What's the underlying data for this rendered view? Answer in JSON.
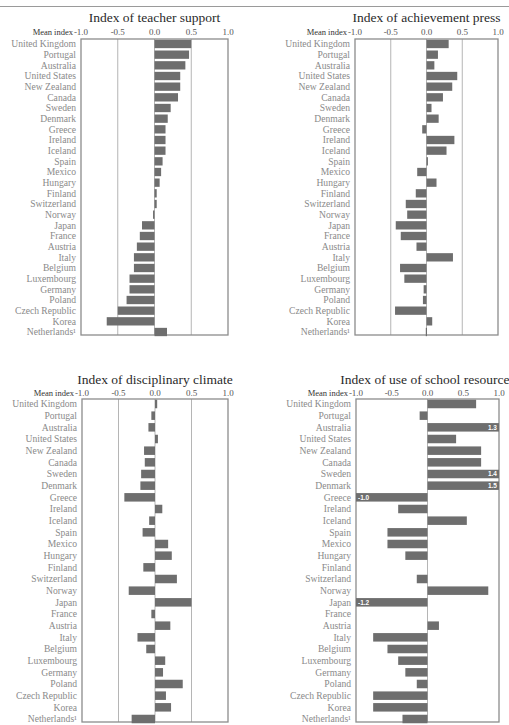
{
  "chart_data": [
    {
      "type": "bar",
      "orientation": "horizontal",
      "title": "Index of teacher support",
      "xlabel": "Mean index",
      "xlim": [
        -1.0,
        1.0
      ],
      "xticks": [
        "-1.0",
        "-0.5",
        "0.0",
        "0.5",
        "1.0"
      ],
      "grid": true,
      "categories": [
        "United Kingdom",
        "Portugal",
        "Australia",
        "United States",
        "New Zealand",
        "Canada",
        "Sweden",
        "Denmark",
        "Greece",
        "Ireland",
        "Iceland",
        "Spain",
        "Mexico",
        "Hungary",
        "Finland",
        "Switzerland",
        "Norway",
        "Japan",
        "France",
        "Austria",
        "Italy",
        "Belgium",
        "Luxembourg",
        "Germany",
        "Poland",
        "Czech Republic",
        "Korea",
        "Netherlands¹"
      ],
      "values": [
        0.5,
        0.47,
        0.42,
        0.35,
        0.35,
        0.32,
        0.22,
        0.18,
        0.15,
        0.15,
        0.15,
        0.11,
        0.09,
        0.07,
        0.03,
        0.03,
        -0.02,
        -0.17,
        -0.2,
        -0.24,
        -0.28,
        -0.28,
        -0.34,
        -0.34,
        -0.38,
        -0.5,
        -0.65,
        0.17
      ],
      "bar_labels": {}
    },
    {
      "type": "bar",
      "orientation": "horizontal",
      "title": "Index of achievement press",
      "xlabel": "Mean index",
      "xlim": [
        -1.0,
        1.0
      ],
      "xticks": [
        "-1.0",
        "-0.5",
        "0.0",
        "0.5",
        "1.0"
      ],
      "grid": true,
      "categories": [
        "United Kingdom",
        "Portugal",
        "Australia",
        "United States",
        "New Zealand",
        "Canada",
        "Sweden",
        "Denmark",
        "Greece",
        "Ireland",
        "Iceland",
        "Spain",
        "Mexico",
        "Hungary",
        "Finland",
        "Switzerland",
        "Norway",
        "Japan",
        "France",
        "Austria",
        "Italy",
        "Belgium",
        "Luxembourg",
        "Germany",
        "Poland",
        "Czech Republic",
        "Korea",
        "Netherlands¹"
      ],
      "values": [
        0.31,
        0.16,
        0.11,
        0.43,
        0.36,
        0.23,
        0.07,
        0.17,
        -0.06,
        0.39,
        0.28,
        0.02,
        -0.13,
        0.14,
        -0.15,
        -0.29,
        -0.27,
        -0.43,
        -0.36,
        -0.14,
        0.37,
        -0.37,
        -0.31,
        -0.04,
        -0.05,
        -0.44,
        0.08,
        -0.01
      ],
      "bar_labels": {}
    },
    {
      "type": "bar",
      "orientation": "horizontal",
      "title": "Index of disciplinary climate",
      "xlabel": "Mean index",
      "xlim": [
        -1.0,
        1.0
      ],
      "xticks": [
        "-1.0",
        "-0.5",
        "0.0",
        "0.5",
        "1.0"
      ],
      "grid": true,
      "categories": [
        "United Kingdom",
        "Portugal",
        "Australia",
        "United States",
        "New Zealand",
        "Canada",
        "Sweden",
        "Denmark",
        "Greece",
        "Ireland",
        "Iceland",
        "Spain",
        "Mexico",
        "Hungary",
        "Finland",
        "Switzerland",
        "Norway",
        "Japan",
        "France",
        "Austria",
        "Italy",
        "Belgium",
        "Luxembourg",
        "Germany",
        "Poland",
        "Czech Republic",
        "Korea",
        "Netherlands¹"
      ],
      "values": [
        0.03,
        -0.05,
        -0.09,
        0.04,
        -0.15,
        -0.14,
        -0.19,
        -0.2,
        -0.42,
        0.1,
        -0.08,
        -0.17,
        0.18,
        0.23,
        -0.16,
        0.3,
        -0.36,
        0.5,
        -0.05,
        0.21,
        -0.24,
        -0.12,
        0.14,
        0.11,
        0.38,
        0.15,
        0.22,
        -0.32
      ],
      "bar_labels": {}
    },
    {
      "type": "bar",
      "orientation": "horizontal",
      "title": "Index of use of school resources",
      "xlabel": "Mean index",
      "xlim": [
        -1.0,
        1.0
      ],
      "xticks": [
        "-1.0",
        "-0.5",
        "0.0",
        "0.5",
        "1.0"
      ],
      "grid": false,
      "categories": [
        "United Kingdom",
        "Portugal",
        "Australia",
        "United States",
        "New Zealand",
        "Canada",
        "Sweden",
        "Denmark",
        "Greece",
        "Ireland",
        "Iceland",
        "Spain",
        "Mexico",
        "Hungary",
        "Finland",
        "Switzerland",
        "Norway",
        "Japan",
        "France",
        "Austria",
        "Italy",
        "Belgium",
        "Luxembourg",
        "Germany",
        "Poland",
        "Czech Republic",
        "Korea",
        "Netherlands¹"
      ],
      "values": [
        0.68,
        -0.11,
        1.3,
        0.4,
        0.75,
        0.75,
        1.4,
        1.5,
        -1.0,
        -0.41,
        0.55,
        -0.56,
        -0.56,
        -0.31,
        null,
        -0.15,
        0.85,
        -1.2,
        null,
        0.16,
        -0.76,
        -0.56,
        -0.41,
        -0.31,
        -0.15,
        -0.76,
        -0.76,
        -0.35
      ],
      "bar_labels": {
        "2": "1.3",
        "6": "1.4",
        "7": "1.5",
        "8": "-1.0",
        "17": "-1.2"
      }
    }
  ]
}
